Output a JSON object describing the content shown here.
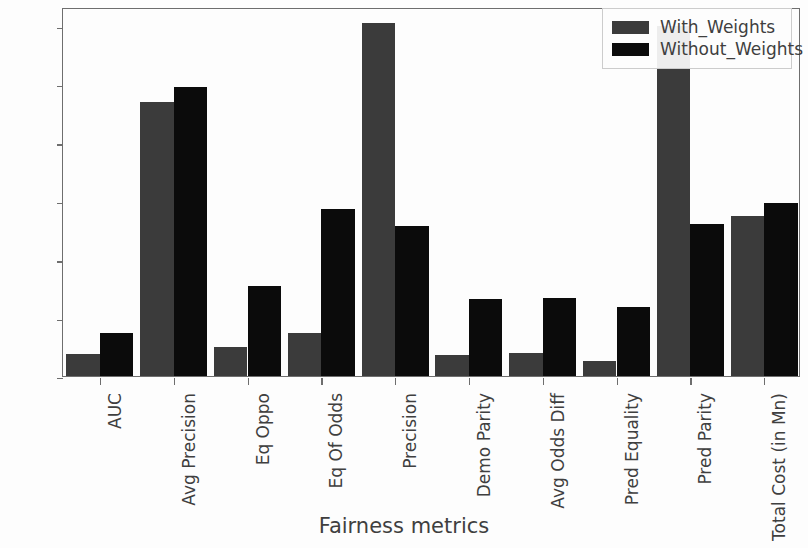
{
  "chart_data": {
    "type": "bar",
    "title": "",
    "xlabel": "Fairness metrics",
    "ylabel": "",
    "ylim": [
      0.0,
      0.3159
    ],
    "yticks": [
      0.0,
      0.05,
      0.1,
      0.15,
      0.2,
      0.25,
      0.3
    ],
    "ytick_labels": [
      "0.00",
      "0.05",
      "0.10",
      "0.15",
      "0.20",
      "0.25",
      "0.30"
    ],
    "grid": false,
    "legend_position": "upper right",
    "categories": [
      "AUC",
      "Avg Precision",
      "Eq Oppo",
      "Eq Of Odds",
      "Precision",
      "Demo Parity",
      "Avg Odds Diff",
      "Pred Equality",
      "Pred Parity",
      "Total Cost (in Mn)"
    ],
    "series": [
      {
        "name": "With_Weights",
        "color": "#3b3b3b",
        "values": [
          0.019,
          0.235,
          0.025,
          0.037,
          0.302,
          0.018,
          0.02,
          0.013,
          0.3,
          0.137
        ]
      },
      {
        "name": "Without_Weights",
        "color": "#0b0b0b",
        "values": [
          0.037,
          0.247,
          0.077,
          0.143,
          0.128,
          0.066,
          0.067,
          0.059,
          0.13,
          0.148
        ]
      }
    ]
  },
  "legend": {
    "entries": [
      {
        "label": "With_Weights",
        "swatch": "with"
      },
      {
        "label": "Without_Weights",
        "swatch": "without"
      }
    ]
  }
}
